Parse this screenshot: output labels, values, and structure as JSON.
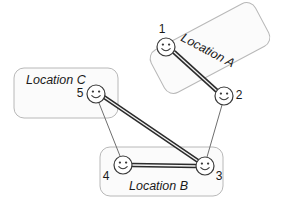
{
  "diagram": {
    "canvas": {
      "width": 282,
      "height": 207,
      "background": "#ffffff"
    },
    "colors": {
      "box_stroke": "#b8b8b8",
      "box_fill": "#fbfbfb",
      "node_stroke": "#3a3a3a",
      "node_fill": "#ffffff",
      "thick_edge": "#2b2b2b",
      "thin_edge": "#6e6e6e",
      "text": "#1a1a1a"
    },
    "locations": [
      {
        "id": "location-a",
        "label": "Location A",
        "shape": "rounded-rect",
        "rotation_deg": -28,
        "x": 151,
        "y": 24,
        "width": 118,
        "height": 48,
        "label_x": 206,
        "label_y": 54,
        "label_rotation_deg": 28
      },
      {
        "id": "location-c",
        "label": "Location C",
        "shape": "rounded-rect",
        "rotation_deg": 0,
        "x": 14,
        "y": 68,
        "width": 104,
        "height": 50,
        "label_x": 26,
        "label_y": 84,
        "label_rotation_deg": 0
      },
      {
        "id": "location-b",
        "label": "Location B",
        "shape": "rounded-rect",
        "rotation_deg": 0,
        "x": 100,
        "y": 147,
        "width": 123,
        "height": 49,
        "label_x": 129,
        "label_y": 190,
        "label_rotation_deg": 0
      }
    ],
    "nodes": [
      {
        "id": "node-1",
        "number": "1",
        "x": 166,
        "y": 47,
        "r": 9,
        "location": "location-a",
        "label_x": 162,
        "label_y": 33
      },
      {
        "id": "node-2",
        "number": "2",
        "x": 224,
        "y": 96,
        "r": 9,
        "location": "location-a",
        "label_x": 239,
        "label_y": 99
      },
      {
        "id": "node-3",
        "number": "3",
        "x": 205,
        "y": 166,
        "r": 9,
        "location": "location-b",
        "label_x": 219,
        "label_y": 180
      },
      {
        "id": "node-4",
        "number": "4",
        "x": 123,
        "y": 165,
        "r": 9,
        "location": "location-b",
        "label_x": 106,
        "label_y": 180
      },
      {
        "id": "node-5",
        "number": "5",
        "x": 96,
        "y": 94,
        "r": 9,
        "location": "location-c",
        "label_x": 80,
        "label_y": 97
      }
    ],
    "edges": [
      {
        "id": "edge-1-2",
        "from": "node-1",
        "to": "node-2",
        "x1": 174,
        "y1": 52,
        "x2": 217,
        "y2": 91,
        "style": "thick-double"
      },
      {
        "id": "edge-5-3",
        "from": "node-5",
        "to": "node-3",
        "x1": 104,
        "y1": 97,
        "x2": 198,
        "y2": 161,
        "style": "thick-double"
      },
      {
        "id": "edge-4-3",
        "from": "node-4",
        "to": "node-3",
        "x1": 132,
        "y1": 165,
        "x2": 196,
        "y2": 166,
        "style": "thick-double"
      },
      {
        "id": "edge-5-4",
        "from": "node-5",
        "to": "node-4",
        "x1": 99,
        "y1": 103,
        "x2": 120,
        "y2": 156,
        "style": "thin-single"
      },
      {
        "id": "edge-2-3",
        "from": "node-2",
        "to": "node-3",
        "x1": 222,
        "y1": 105,
        "x2": 207,
        "y2": 157,
        "style": "thin-single"
      }
    ]
  }
}
